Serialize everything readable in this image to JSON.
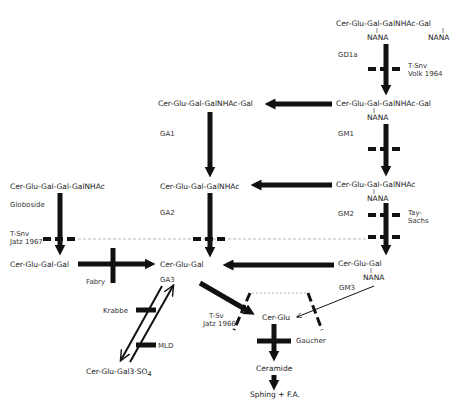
{
  "compounds": {
    "gd1a": "Cer-Glu-Gal-GalNHAc-Gal",
    "gd1a_nana1": "NANA",
    "gd1a_nana2": "NANA",
    "ga1": "Cer-Glu-Gal-GalNHAc-Gal",
    "gm1": "Cer-Glu-Gal-GalNHAc-Gal",
    "gm1_nana": "NANA",
    "ga2": "Cer-Glu-Gal-GalNHAc",
    "gm2": "Cer-Glu-Gal-GalNHAc",
    "gm2_nana": "NANA",
    "globoside": "Cer-Glu-Gal-Gal-GalNHAc",
    "trihexoside": "Cer-Glu-Gal-Gal",
    "ga3": "Cer-Glu-Gal",
    "gm3": "Cer-Glu-Gal",
    "gm3_nana": "NANA",
    "sulfatide": "Cer-Glu-Gal3·SO",
    "sulfatide_sub": "4",
    "cerglu": "Cer-Glu",
    "ceramide": "Ceramide",
    "sphing": "Sphing + F.A."
  },
  "labels": {
    "gd1a": "GD1a",
    "gm1": "GM1",
    "ga1": "GA1",
    "ga2": "GA2",
    "gm2": "GM2",
    "globoside": "Globoside",
    "ga3": "GA3",
    "gm3": "GM3"
  },
  "diseases": {
    "tsnv_volk_1": "T-Snv",
    "tsnv_volk_2": "Volk 1964",
    "tay_sachs_1": "Tay-",
    "tay_sachs_2": "Sachs",
    "tsnv_jatz_1": "T-Snv",
    "tsnv_jatz_2": "Jatz 1967",
    "fabry": "Fabry",
    "krabbe": "Krabbe",
    "mld": "MLD",
    "tsv_jatz_1": "T-Sv",
    "tsv_jatz_2": "Jatz 1966",
    "gaucher": "Gaucher"
  }
}
